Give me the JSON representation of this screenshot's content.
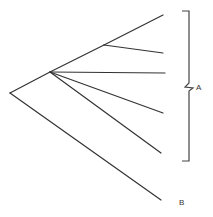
{
  "diagram": {
    "type": "phylogenetic-tree",
    "labels": {
      "group_a": "A",
      "group_b": "B"
    },
    "nodes": {
      "root": [
        10,
        93
      ],
      "clade_a": [
        50,
        72
      ],
      "sub_clade": [
        104,
        45
      ]
    },
    "edges": [
      {
        "from": [
          10,
          93
        ],
        "to": [
          50,
          72
        ]
      },
      {
        "from": [
          10,
          93
        ],
        "to": [
          161,
          200
        ]
      },
      {
        "from": [
          50,
          72
        ],
        "to": [
          104,
          45
        ]
      },
      {
        "from": [
          104,
          45
        ],
        "to": [
          163,
          15
        ]
      },
      {
        "from": [
          104,
          45
        ],
        "to": [
          163,
          53
        ]
      },
      {
        "from": [
          50,
          72
        ],
        "to": [
          165,
          73
        ]
      },
      {
        "from": [
          50,
          72
        ],
        "to": [
          163,
          113
        ]
      },
      {
        "from": [
          50,
          72
        ],
        "to": [
          161,
          153
        ]
      }
    ],
    "bracket": {
      "x_left": 182,
      "x_right": 189,
      "y_top": 11,
      "y_bottom": 161,
      "notch_y": 87
    }
  }
}
